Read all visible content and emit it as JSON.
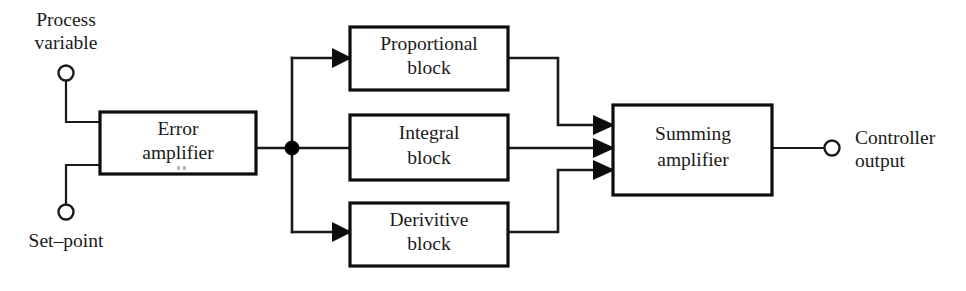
{
  "diagram": {
    "background_color": "#ffffff",
    "line_color": "#1a1a1a",
    "block_fill": "#ffffff",
    "blocks": [
      {
        "id": "error-amplifier",
        "line1": "Error",
        "line2": "amplifier",
        "x": 100,
        "y": 112,
        "w": 156,
        "h": 62
      },
      {
        "id": "proportional-block",
        "line1": "Proportional",
        "line2": "block",
        "x": 350,
        "y": 27,
        "w": 158,
        "h": 63
      },
      {
        "id": "integral-block",
        "line1": "Integral",
        "line2": "block",
        "x": 350,
        "y": 115,
        "w": 158,
        "h": 65
      },
      {
        "id": "derivitive-block",
        "line1": "Derivitive",
        "line2": "block",
        "x": 350,
        "y": 203,
        "w": 158,
        "h": 63
      },
      {
        "id": "summing-amplifier",
        "line1": "Summing",
        "line2": "amplifier",
        "x": 613,
        "y": 105,
        "w": 159,
        "h": 90
      }
    ],
    "terminals": [
      {
        "id": "process-variable",
        "line1": "Process",
        "line2": "variable",
        "cx": 66,
        "cy": 73,
        "r": 7.5,
        "label_x": 66,
        "label_y1": 22,
        "label_y2": 45
      },
      {
        "id": "set-point",
        "line1": "Set–point",
        "line2": "",
        "cx": 66,
        "cy": 212,
        "r": 7.5,
        "label_x": 66,
        "label_y1": 243,
        "label_y2": 0
      },
      {
        "id": "controller-output",
        "line1": "Controller",
        "line2": "output",
        "cx": 832,
        "cy": 148,
        "r": 7.5,
        "label_x": 855,
        "label_y1": 140,
        "label_y2": 163
      }
    ],
    "junction": {
      "id": "signal-split-node",
      "cx": 292,
      "cy": 148,
      "r": 7
    },
    "summing_inputs": [
      {
        "id": "summing-input-proportional",
        "y": 125
      },
      {
        "id": "summing-input-integral",
        "y": 148
      },
      {
        "id": "summing-input-derivitive",
        "y": 170
      }
    ]
  }
}
